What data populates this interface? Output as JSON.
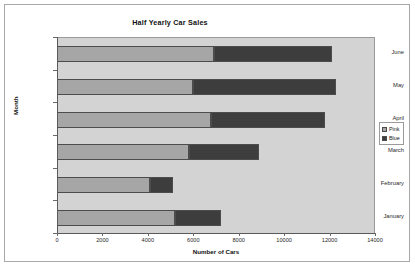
{
  "chart_data": {
    "type": "bar",
    "orientation": "horizontal",
    "stacked": true,
    "title": "Half Yearly Car Sales",
    "xlabel": "Number of Cars",
    "ylabel": "Month",
    "categories": [
      "January",
      "February",
      "March",
      "April",
      "May",
      "June"
    ],
    "series": [
      {
        "name": "Pink",
        "color": "#a6a6a6",
        "values": [
          5200,
          4100,
          5800,
          6800,
          6000,
          6900
        ]
      },
      {
        "name": "Blue",
        "color": "#3d3d3d",
        "values": [
          2000,
          1000,
          3100,
          5000,
          6300,
          5200
        ]
      }
    ],
    "totals": [
      7200,
      5100,
      8900,
      11800,
      12300,
      12100
    ],
    "xlim": [
      0,
      14000
    ],
    "xticks": [
      0,
      2000,
      4000,
      6000,
      8000,
      10000,
      12000,
      14000
    ],
    "xtick_labels": [
      "0",
      "2000",
      "4000",
      "6000",
      "8000",
      "10000",
      "12000",
      "14000"
    ],
    "grid": false,
    "legend_position": "right",
    "plot_background": "#d3d3d3",
    "canvas_background": "#ffffff"
  },
  "legend": {
    "entries": [
      {
        "label": "Pink",
        "color": "#a6a6a6"
      },
      {
        "label": "Blue",
        "color": "#3d3d3d"
      }
    ]
  }
}
